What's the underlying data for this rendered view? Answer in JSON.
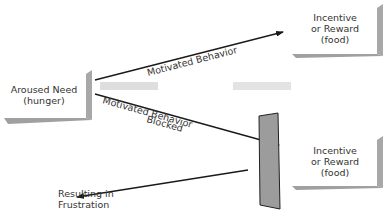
{
  "diagram": {
    "nodes": {
      "aroused_need": {
        "line1": "Aroused Need",
        "line2": "(hunger)"
      },
      "incentive_top": {
        "line1": "Incentive",
        "line2": "or Reward",
        "line3": "(food)"
      },
      "incentive_bottom": {
        "line1": "Incentive",
        "line2": "or Reward",
        "line3": "(food)"
      },
      "frustration": {
        "line1": "Resulting in",
        "line2": "Frustration"
      }
    },
    "edges": {
      "motivated": {
        "label": "Motivated Behavior"
      },
      "blocked": {
        "line1": "Motivated Behavior",
        "line2": "Blocked"
      }
    },
    "colors": {
      "shadow": "#9a9a9a",
      "barrier_fill": "#9c9c9c",
      "barrier_stroke": "#222222",
      "arrow": "#1a1a1a",
      "smudge": "#c8c8c8"
    }
  }
}
